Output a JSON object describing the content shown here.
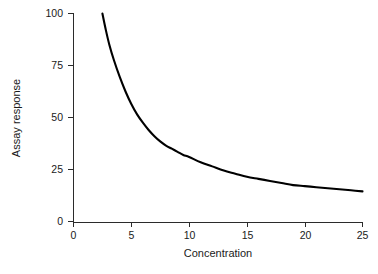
{
  "chart_data": {
    "type": "line",
    "title": "",
    "subtitle": "",
    "xlabel": "Concentration",
    "ylabel": "Assay response",
    "xlim": [
      0,
      25
    ],
    "ylim": [
      0,
      100
    ],
    "xticks": [
      0,
      5,
      10,
      15,
      20,
      25
    ],
    "yticks": [
      0,
      25,
      50,
      75,
      100
    ],
    "xtick_labels": [
      "0",
      "5",
      "10",
      "15",
      "20",
      "25"
    ],
    "ytick_labels": [
      "0",
      "25",
      "50",
      "75",
      "100"
    ],
    "grid": false,
    "legend": false,
    "legend_position": "none",
    "line_color": "#000000",
    "axis_color": "#2b2b2b",
    "background_color": "#ffffff",
    "annotations": [],
    "series": [
      {
        "name": "Assay response vs concentration",
        "color": "#000000",
        "x": [
          2.5,
          2.8,
          3.1,
          3.5,
          4.0,
          4.5,
          5.0,
          5.5,
          6.0,
          6.5,
          7.0,
          7.5,
          8.0,
          8.5,
          9.0,
          9.5,
          10.0,
          11.0,
          12.0,
          13.0,
          14.0,
          15.0,
          16.0,
          17.0,
          18.0,
          19.0,
          20.0,
          21.0,
          22.0,
          23.0,
          24.0,
          25.0
        ],
        "y": [
          100.0,
          92.0,
          85.0,
          77.5,
          69.5,
          62.5,
          56.5,
          51.5,
          47.5,
          44.0,
          41.0,
          38.5,
          36.5,
          35.0,
          33.5,
          32.0,
          31.0,
          28.5,
          26.5,
          24.5,
          23.0,
          21.5,
          20.5,
          19.5,
          18.5,
          17.5,
          17.0,
          16.5,
          16.0,
          15.5,
          15.0,
          14.5
        ]
      }
    ]
  },
  "figure": {
    "caption_partial": ""
  }
}
